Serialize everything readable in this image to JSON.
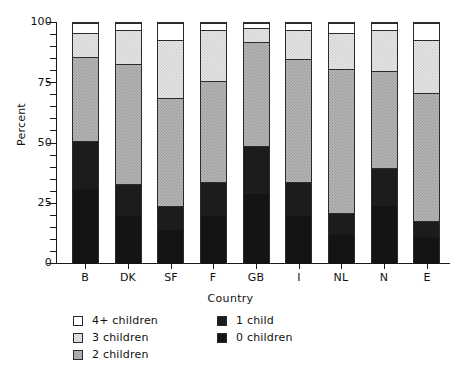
{
  "chart_data": {
    "type": "bar",
    "subtype": "stacked-bar-100-percent",
    "title": "",
    "xlabel": "Country",
    "ylabel": "Percent",
    "categories": [
      "B",
      "DK",
      "SF",
      "F",
      "GB",
      "I",
      "NL",
      "N",
      "E"
    ],
    "ylim": [
      0,
      100
    ],
    "yticks": [
      0,
      25,
      50,
      75,
      100
    ],
    "ytick_labels": [
      "0",
      "25",
      "50",
      "75",
      "100"
    ],
    "minor_ticks": true,
    "grid": false,
    "legend_position": "below-axes",
    "stack_order_bottom_to_top": [
      "0 children",
      "1 child",
      "2 children",
      "3 children",
      "4+ children"
    ],
    "series": [
      {
        "name": "0 children",
        "color": "#141414",
        "swatch": "solid-black",
        "values": [
          31,
          20,
          14,
          20,
          29,
          20,
          12,
          24,
          11
        ]
      },
      {
        "name": "1 child",
        "color": "#1c1c1c",
        "swatch": "solid-black",
        "values": [
          20,
          13,
          10,
          14,
          20,
          14,
          9,
          16,
          7
        ]
      },
      {
        "name": "2 children",
        "color": "#b8b8b8",
        "swatch": "medium-gray-dither",
        "values": [
          35,
          50,
          45,
          42,
          43,
          51,
          60,
          40,
          53
        ]
      },
      {
        "name": "3 children",
        "color": "#e6e6e6",
        "swatch": "light-gray-dither",
        "values": [
          10,
          14,
          24,
          21,
          6,
          12,
          15,
          17,
          22
        ]
      },
      {
        "name": "4+ children",
        "color": "#ffffff",
        "swatch": "white",
        "values": [
          4,
          3,
          7,
          3,
          2,
          3,
          4,
          3,
          7
        ]
      }
    ],
    "cumulative_tops": {
      "B": [
        31,
        51,
        86,
        96,
        100
      ],
      "DK": [
        20,
        33,
        83,
        97,
        100
      ],
      "SF": [
        14,
        24,
        69,
        93,
        100
      ],
      "F": [
        20,
        34,
        76,
        97,
        100
      ],
      "GB": [
        29,
        49,
        92,
        98,
        100
      ],
      "I": [
        20,
        34,
        85,
        97,
        100
      ],
      "NL": [
        12,
        21,
        81,
        96,
        100
      ],
      "N": [
        24,
        40,
        80,
        97,
        100
      ],
      "E": [
        11,
        18,
        71,
        93,
        100
      ]
    },
    "legend_entries_left": [
      "4+ children",
      "3 children",
      "2 children"
    ],
    "legend_entries_right": [
      "1 child",
      "0 children"
    ]
  }
}
